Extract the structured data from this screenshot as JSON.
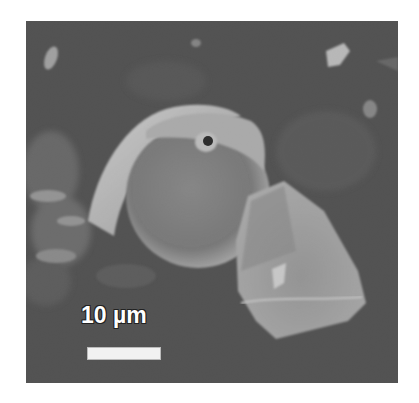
{
  "image": {
    "type": "SEM micrograph",
    "subject": "spherical particle with surface pore adjacent to angular plate-like particle",
    "palette": {
      "background": "#ffffff",
      "substrate": "#4a4a4a",
      "particle_light": "#c8c8c8",
      "particle_mid": "#8c8c8c"
    }
  },
  "scale_bar": {
    "label": "10 µm",
    "value": 10,
    "unit": "µm",
    "color": "#f2f2f2"
  }
}
